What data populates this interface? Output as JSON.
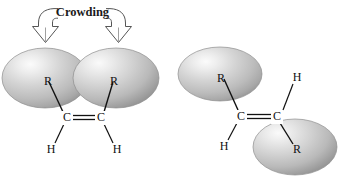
{
  "figure": {
    "title": "",
    "annotation": {
      "label": "Crowding"
    },
    "colors": {
      "sphere_highlight": "#f2f2f2",
      "sphere_mid": "#c9c9c9",
      "sphere_edge": "#8f8f8f",
      "bond_stroke": "#111111",
      "arrow_stroke": "#4a4a4a",
      "text": "#111111",
      "background": "#ffffff"
    }
  },
  "structures": [
    {
      "name": "cis-alkene",
      "groups": [
        {
          "label": "R",
          "position": "upper-left"
        },
        {
          "label": "R",
          "position": "upper-right"
        },
        {
          "label": "H",
          "position": "lower-left"
        },
        {
          "label": "H",
          "position": "lower-right"
        }
      ],
      "carbons": [
        {
          "label": "C"
        },
        {
          "label": "C"
        }
      ],
      "bond": {
        "type": "double",
        "symbol": "="
      },
      "spheres": 2,
      "crowded": "true"
    },
    {
      "name": "trans-alkene",
      "groups": [
        {
          "label": "R",
          "position": "upper-left"
        },
        {
          "label": "H",
          "position": "upper-right"
        },
        {
          "label": "H",
          "position": "lower-left"
        },
        {
          "label": "R",
          "position": "lower-right"
        }
      ],
      "carbons": [
        {
          "label": "C"
        },
        {
          "label": "C"
        }
      ],
      "bond": {
        "type": "double",
        "symbol": "="
      },
      "spheres": 2,
      "crowded": "false"
    }
  ],
  "labels": {
    "cis": {
      "r_left": "R",
      "r_right": "R",
      "c_left": "C",
      "c_right": "C",
      "h_left": "H",
      "h_right": "H"
    },
    "trans": {
      "r_upper": "R",
      "h_upper": "H",
      "c_left": "C",
      "c_right": "C",
      "h_lower": "H",
      "r_lower": "R"
    }
  }
}
